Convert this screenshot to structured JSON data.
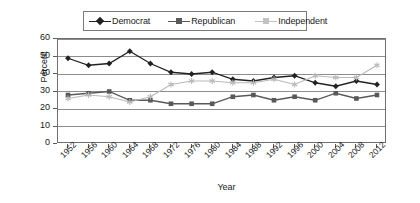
{
  "chart_data": {
    "type": "line",
    "title": "",
    "xlabel": "Year",
    "ylabel": "Percent",
    "ylim": [
      0,
      60
    ],
    "ytick_step": 10,
    "yticks": [
      0,
      10,
      20,
      30,
      40,
      50,
      60
    ],
    "grid": true,
    "legend_position": "top-center",
    "categories": [
      "1952",
      "1956",
      "1960",
      "1964",
      "1968",
      "1972",
      "1976",
      "1980",
      "1984",
      "1988",
      "1992",
      "1996",
      "2000",
      "2004",
      "2008",
      "2012"
    ],
    "series": [
      {
        "name": "Democrat",
        "marker": "diamond",
        "color": "#222222",
        "values": [
          49,
          45,
          46,
          53,
          46,
          41,
          40,
          41,
          37,
          36,
          38,
          39,
          35,
          33,
          36,
          34
        ]
      },
      {
        "name": "Republican",
        "marker": "square",
        "color": "#595959",
        "values": [
          28,
          29,
          30,
          25,
          25,
          23,
          23,
          23,
          27,
          28,
          25,
          27,
          25,
          29,
          26,
          28
        ]
      },
      {
        "name": "Independent",
        "marker": "star",
        "color": "#b9b9b9",
        "values": [
          26,
          28,
          27,
          24,
          27,
          34,
          36,
          36,
          35,
          35,
          37,
          34,
          39,
          38,
          38,
          45
        ]
      }
    ]
  },
  "legend": {
    "entries": [
      {
        "label": "Democrat"
      },
      {
        "label": "Republican"
      },
      {
        "label": "Independent"
      }
    ]
  },
  "axes": {
    "y_title": "Percent",
    "x_title": "Year"
  }
}
